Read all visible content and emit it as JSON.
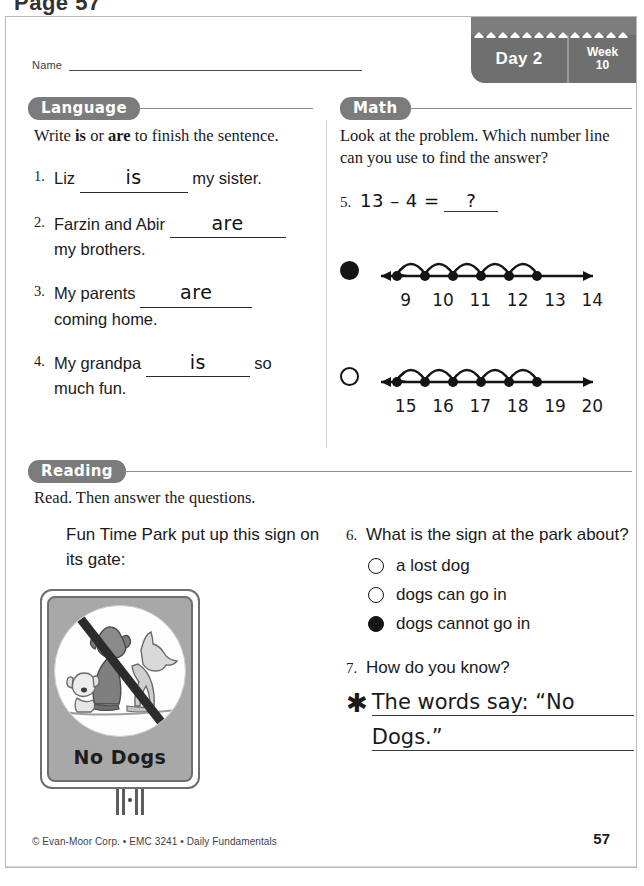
{
  "page_label": "Page 57",
  "header": {
    "name_label": "Name",
    "day": "Day 2",
    "week_word": "Week",
    "week_number": "10"
  },
  "sections": {
    "language": "Language",
    "math": "Math",
    "reading": "Reading"
  },
  "language": {
    "instruction_pre": "Write ",
    "instruction_b1": "is",
    "instruction_mid": " or ",
    "instruction_b2": "are",
    "instruction_post": " to finish the sentence.",
    "items": [
      {
        "num": "1.",
        "before": "Liz",
        "answer": "is",
        "after": "my sister."
      },
      {
        "num": "2.",
        "before": "Farzin and Abir",
        "answer": "are",
        "after": "my brothers."
      },
      {
        "num": "3.",
        "before": "My parents",
        "answer": "are",
        "after": "coming home."
      },
      {
        "num": "4.",
        "before": "My grandpa",
        "answer": "is",
        "after": "so much fun."
      }
    ]
  },
  "math": {
    "instruction": "Look at the problem. Which number line can you use to find the answer?",
    "problem_num": "5.",
    "problem": "13 – 4 =",
    "problem_answer": "?",
    "numberlines": [
      {
        "selected": true,
        "labels": [
          "9",
          "10",
          "11",
          "12",
          "13",
          "14"
        ]
      },
      {
        "selected": false,
        "labels": [
          "15",
          "16",
          "17",
          "18",
          "19",
          "20"
        ]
      }
    ]
  },
  "reading": {
    "instruction": "Read. Then answer the questions.",
    "passage": "Fun Time Park put up this sign on its gate:",
    "sign_text": "No Dogs",
    "question6": {
      "num": "6.",
      "text": "What is the sign at the park about?",
      "choices": [
        {
          "label": "a lost dog",
          "selected": false
        },
        {
          "label": "dogs can go in",
          "selected": false
        },
        {
          "label": "dogs cannot go in",
          "selected": true
        }
      ]
    },
    "question7": {
      "num": "7.",
      "text": "How do you know?",
      "star": "✱",
      "answer_line1": "The words say: “No",
      "answer_line2": "Dogs.”"
    }
  },
  "footer": {
    "copyright": "© Evan-Moor Corp. • EMC 3241 • Daily Fundamentals",
    "page_number": "57"
  },
  "colors": {
    "pill_gray": "#7b7b7b",
    "badge_gray": "#6f6f6f",
    "sign_gray": "#a8a8a8",
    "ink": "#1a1a1a"
  }
}
